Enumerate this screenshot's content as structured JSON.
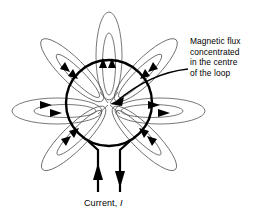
{
  "figure": {
    "type": "physics-field-line-diagram",
    "background_color": "#ffffff",
    "stroke_color": "#000000",
    "field_line_color": "#555555",
    "width": 265,
    "height": 218
  },
  "annotation": {
    "line1": "Magnetic flux",
    "line2": "concentrated",
    "line3": "in the centre",
    "line4": "of the loop",
    "pointer": "curved-arrow-to-loop-centre"
  },
  "current": {
    "label_prefix": "Current, ",
    "symbol": "I",
    "left_lead_direction": "up",
    "right_lead_direction": "down"
  },
  "loop": {
    "center_x": 109,
    "center_y": 103,
    "radius": 43,
    "stroke_width": 2.4
  },
  "field_lobes": [
    {
      "name": "top",
      "angle_deg": 270,
      "arrow_direction": "inward"
    },
    {
      "name": "top-right",
      "angle_deg": 315,
      "arrow_direction": "inward"
    },
    {
      "name": "right",
      "angle_deg": 0,
      "arrow_direction": "inward"
    },
    {
      "name": "bottom-right",
      "angle_deg": 45,
      "arrow_direction": "inward"
    },
    {
      "name": "bottom-left",
      "angle_deg": 135,
      "arrow_direction": "inward"
    },
    {
      "name": "left",
      "angle_deg": 180,
      "arrow_direction": "inward"
    },
    {
      "name": "top-left",
      "angle_deg": 225,
      "arrow_direction": "inward"
    }
  ]
}
